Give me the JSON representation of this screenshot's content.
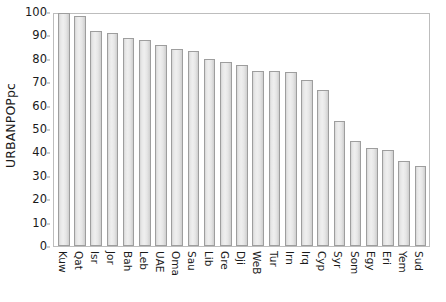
{
  "chart_data": {
    "type": "bar",
    "title": "",
    "xlabel": "",
    "ylabel": "URBANPOPpc",
    "ylim": [
      0,
      100
    ],
    "ytick_step": 10,
    "yticks": [
      0,
      10,
      20,
      30,
      40,
      50,
      60,
      70,
      80,
      90,
      100
    ],
    "grid": false,
    "legend": "none",
    "bar_fill_color": "#e8e8e8",
    "bar_border_color": "#9e9e9e",
    "frame_color": "#bdbdbd",
    "categories": [
      "Kuw",
      "Qat",
      "Isr",
      "Jor",
      "Bah",
      "Leb",
      "UAE",
      "Oma",
      "Sau",
      "Lib",
      "Gre",
      "Dji",
      "WeB",
      "Tur",
      "Irn",
      "Irq",
      "Cyp",
      "Syr",
      "Som",
      "Egy",
      "Eri",
      "Yem",
      "Sud"
    ],
    "values": [
      99.5,
      98.5,
      92,
      91,
      89,
      88,
      86,
      84,
      83.5,
      80,
      78.5,
      77.5,
      75,
      75,
      74.5,
      71,
      66.5,
      53.5,
      45,
      42,
      41,
      36.5,
      34
    ]
  }
}
